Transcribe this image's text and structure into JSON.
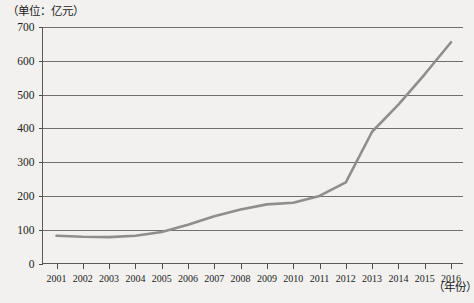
{
  "chart_data": {
    "type": "line",
    "title": "",
    "subtitle": "",
    "unit_label": "（单位：亿元）",
    "xlabel": "（年份）",
    "ylabel": "",
    "grid": true,
    "legend": null,
    "xlim": [
      2001,
      2016
    ],
    "ylim": [
      0,
      700
    ],
    "ytick_step": 100,
    "categories": [
      "2001",
      "2002",
      "2003",
      "2004",
      "2005",
      "2006",
      "2007",
      "2008",
      "2009",
      "2010",
      "2011",
      "2012",
      "2013",
      "2014",
      "2015",
      "2016"
    ],
    "x": [
      2001,
      2002,
      2003,
      2004,
      2005,
      2006,
      2007,
      2008,
      2009,
      2010,
      2011,
      2012,
      2013,
      2014,
      2015,
      2016
    ],
    "values": [
      82,
      79,
      78,
      82,
      93,
      115,
      140,
      160,
      175,
      180,
      200,
      240,
      390,
      470,
      560,
      655
    ],
    "yticks": [
      "0",
      "100",
      "200",
      "300",
      "400",
      "500",
      "600",
      "700"
    ],
    "series": [
      {
        "name": "",
        "values": [
          82,
          79,
          78,
          82,
          93,
          115,
          140,
          160,
          175,
          180,
          200,
          240,
          390,
          470,
          560,
          655
        ]
      }
    ],
    "colors": {
      "line": "#8e8e8e",
      "grid": "#6f6f6f",
      "axis": "#5a5a5a",
      "background": "#f2f1ef",
      "text": "#1c1c1c"
    }
  }
}
